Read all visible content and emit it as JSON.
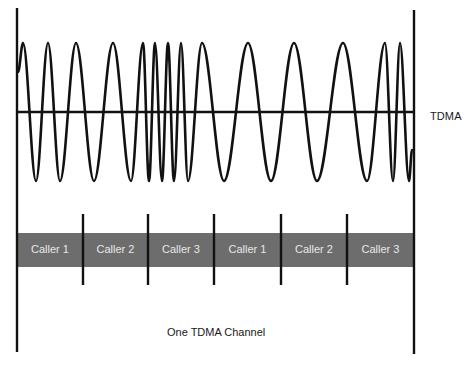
{
  "diagram": {
    "title": "TDMA",
    "caption": "One TDMA Channel",
    "colors": {
      "line": "#111111",
      "slot_bar": "#6d6d6d",
      "slot_text": "#e8e8e8",
      "background": "#ffffff"
    },
    "geometry": {
      "left_axis_x": 17,
      "right_axis_x": 414,
      "axis_top": 9,
      "axis_bottom": 353,
      "midline_y": 112,
      "peak_y": 43,
      "trough_y": 181,
      "bar_top": 233,
      "bar_bottom": 267,
      "divider_top": 214,
      "divider_bottom": 285
    },
    "waveform": {
      "start": [
        18,
        72
      ],
      "extrema": [
        [
          "P",
          23
        ],
        [
          "T",
          36
        ],
        [
          "P",
          48
        ],
        [
          "T",
          60
        ],
        [
          "P",
          76
        ],
        [
          "T",
          94
        ],
        [
          "P",
          113
        ],
        [
          "T",
          131
        ],
        [
          "P",
          143
        ],
        [
          "T",
          149
        ],
        [
          "P",
          155
        ],
        [
          "T",
          162
        ],
        [
          "P",
          168
        ],
        [
          "T",
          174
        ],
        [
          "P",
          181
        ],
        [
          "T",
          188
        ],
        [
          "P",
          202
        ],
        [
          "T",
          224
        ],
        [
          "P",
          248
        ],
        [
          "T",
          271
        ],
        [
          "P",
          294
        ],
        [
          "T",
          317
        ],
        [
          "P",
          343
        ],
        [
          "T",
          367
        ],
        [
          "P",
          385
        ],
        [
          "T",
          393
        ],
        [
          "P",
          400
        ],
        [
          "T",
          409
        ]
      ],
      "end": [
        412,
        150
      ]
    },
    "slots": [
      {
        "label": "Caller 1",
        "x0": 17,
        "x1": 83
      },
      {
        "label": "Caller 2",
        "x0": 83,
        "x1": 148
      },
      {
        "label": "Caller 3",
        "x0": 148,
        "x1": 214
      },
      {
        "label": "Caller 1",
        "x0": 214,
        "x1": 281
      },
      {
        "label": "Caller 2",
        "x0": 281,
        "x1": 347
      },
      {
        "label": "Caller 3",
        "x0": 347,
        "x1": 414
      }
    ],
    "dividers_x": [
      83,
      148,
      214,
      281,
      347
    ]
  }
}
